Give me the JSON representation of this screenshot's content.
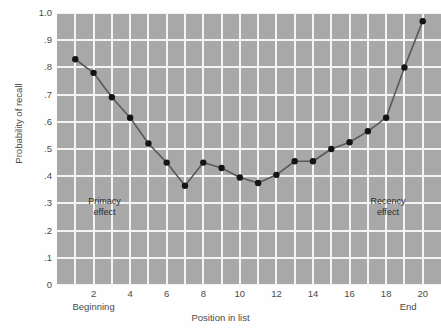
{
  "chart_data": {
    "type": "line",
    "title": "",
    "xlabel": "Position in list",
    "ylabel": "Probability of recall",
    "xlim": [
      0,
      21
    ],
    "ylim": [
      0,
      1.0
    ],
    "grid": true,
    "legend": "none",
    "x": [
      1,
      2,
      3,
      4,
      5,
      6,
      7,
      8,
      9,
      10,
      11,
      12,
      13,
      14,
      15,
      16,
      17,
      18,
      19,
      20
    ],
    "values": [
      0.83,
      0.78,
      0.69,
      0.615,
      0.52,
      0.45,
      0.365,
      0.45,
      0.43,
      0.395,
      0.375,
      0.405,
      0.455,
      0.455,
      0.5,
      0.525,
      0.565,
      0.615,
      0.8,
      0.97
    ],
    "series": [
      {
        "name": "Probability of recall",
        "values": [
          0.83,
          0.78,
          0.69,
          0.615,
          0.52,
          0.45,
          0.365,
          0.45,
          0.43,
          0.395,
          0.375,
          0.405,
          0.455,
          0.455,
          0.5,
          0.525,
          0.565,
          0.615,
          0.8,
          0.97
        ]
      }
    ],
    "y_tick_labels": [
      "1.0",
      ".9",
      ".8",
      ".7",
      ".6",
      ".5",
      ".4",
      ".3",
      ".2",
      ".1",
      "0"
    ],
    "y_tick_values": [
      1.0,
      0.9,
      0.8,
      0.7,
      0.6,
      0.5,
      0.4,
      0.3,
      0.2,
      0.1,
      0.0
    ],
    "x_tick_labels": [
      "2",
      "4",
      "6",
      "8",
      "10",
      "12",
      "14",
      "16",
      "18",
      "20"
    ],
    "x_tick_values": [
      2,
      4,
      6,
      8,
      10,
      12,
      14,
      16,
      18,
      20
    ],
    "annotations": [
      {
        "text_line1": "Primacy",
        "text_line2": "effect",
        "x": 2.6,
        "y": 0.285
      },
      {
        "text_line1": "Recency",
        "text_line2": "effect",
        "x": 18.1,
        "y": 0.285
      }
    ],
    "axis_end_labels": [
      {
        "text": "Beginning",
        "x": 2
      },
      {
        "text": "End",
        "x": 19.2
      }
    ],
    "colors": {
      "plot_background": "#a8a8a8",
      "gridline": "#f4f4f4",
      "line": "#595959",
      "marker": "#141414",
      "text": "#4a4a4a",
      "page_background": "#fefefe"
    }
  }
}
